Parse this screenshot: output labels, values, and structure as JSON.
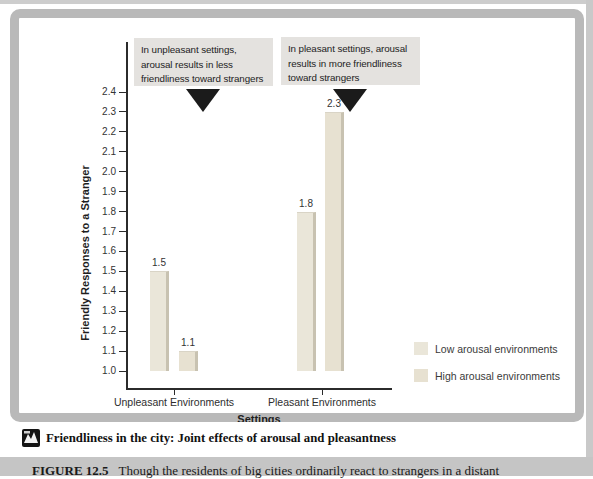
{
  "page": {
    "caption_bar": {
      "title": "Friendliness in the city: Joint effects of arousal and pleasantness"
    },
    "figure_note": {
      "label": "FIGURE 12.5",
      "text": "Though the residents of big cities ordinarily react to strangers in a distant"
    }
  },
  "chart_data": {
    "type": "bar",
    "categories": [
      "Unpleasant Environments",
      "Pleasant Environments"
    ],
    "series": [
      {
        "name": "Low arousal environments",
        "values": [
          1.5,
          1.8
        ],
        "color": "#eae6d9"
      },
      {
        "name": "High arousal environments",
        "values": [
          1.1,
          2.3
        ],
        "color": "#e7e1d1"
      }
    ],
    "bar_value_labels": [
      "1.5",
      "1.1",
      "1.8",
      "2.3"
    ],
    "xlabel": "Settings",
    "ylabel": "Friendly Responses to a Stranger",
    "ylim": [
      1.0,
      2.4
    ],
    "ytick_step": 0.1,
    "grid": false,
    "legend_position": "inside-bottom-right",
    "annotations": [
      {
        "text": "In unpleasant settings, arousal results in less friendliness toward strangers",
        "pointer": "down-triangle"
      },
      {
        "text": "In pleasant settings, arousal results in more friendliness toward strangers",
        "pointer": "down-triangle"
      }
    ],
    "colors": {
      "bar_edge_shade": "#c8c2b1",
      "annotation_bg": "#e4e2df",
      "frame": "#b9b9b9",
      "bottom_strip_bg": "#c5c5c5",
      "axis": "#2b2b2b"
    }
  }
}
